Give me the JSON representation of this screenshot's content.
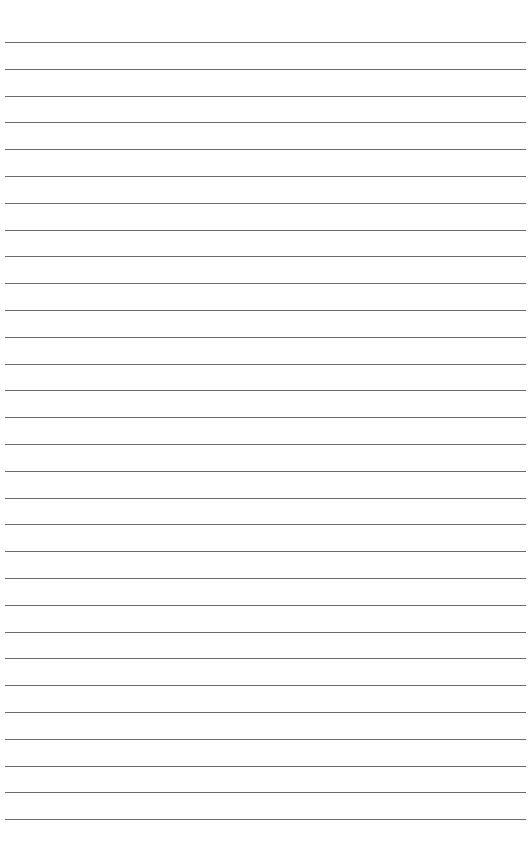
{
  "page": {
    "type": "lined-paper",
    "line_count": 30,
    "first_line_y": 42,
    "line_spacing": 26.8,
    "line_left": 5,
    "line_width": 521,
    "line_color": "#5a5a5a",
    "background": "#ffffff"
  }
}
